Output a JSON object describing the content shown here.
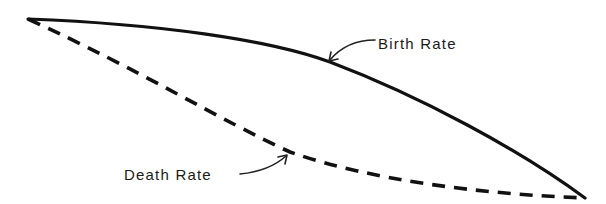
{
  "chart_data": {
    "type": "line",
    "title": "",
    "xlabel": "",
    "ylabel": "",
    "grid": false,
    "axes_visible": false,
    "legend": "inline annotations with leader arrows",
    "series": [
      {
        "name": "Birth Rate",
        "style": "solid",
        "color": "#111111",
        "points_px": [
          [
            28,
            19
          ],
          [
            100,
            24
          ],
          [
            180,
            30
          ],
          [
            260,
            40
          ],
          [
            330,
            62
          ],
          [
            400,
            92
          ],
          [
            470,
            130
          ],
          [
            530,
            165
          ],
          [
            585,
            198
          ]
        ],
        "path": "M28,19 C160,24 270,40 330,62 C420,96 520,150 585,198"
      },
      {
        "name": "Death Rate",
        "style": "dashed",
        "color": "#111111",
        "points_px": [
          [
            28,
            19
          ],
          [
            90,
            45
          ],
          [
            160,
            78
          ],
          [
            230,
            118
          ],
          [
            290,
            152
          ],
          [
            360,
            172
          ],
          [
            440,
            186
          ],
          [
            520,
            194
          ],
          [
            585,
            198
          ]
        ],
        "path": "M28,19 C140,70 220,120 290,152 C370,180 480,194 585,198"
      }
    ],
    "annotations": [
      {
        "text": "Birth Rate",
        "label_pos_px": [
          378,
          45
        ],
        "arrow_to_px": [
          329,
          62
        ]
      },
      {
        "text": "Death Rate",
        "label_pos_px": [
          124,
          182
        ],
        "arrow_to_px": [
          287,
          155
        ]
      }
    ]
  },
  "labels": {
    "birth": "Birth Rate",
    "death": "Death Rate"
  },
  "colors": {
    "line": "#111111",
    "background": "#ffffff"
  }
}
